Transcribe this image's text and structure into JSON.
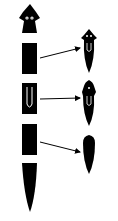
{
  "diagram": {
    "subject": "planarian regeneration",
    "colors": {
      "fill": "#000000",
      "background": "#ffffff",
      "detail": "#ffffff"
    },
    "original_fragments": [
      {
        "id": "head",
        "features": [
          "eyes"
        ]
      },
      {
        "id": "segment-1",
        "features": []
      },
      {
        "id": "segment-2-pharynx",
        "features": [
          "pharynx"
        ]
      },
      {
        "id": "segment-3",
        "features": []
      },
      {
        "id": "tail",
        "features": []
      }
    ],
    "arrows": [
      {
        "from": "segment-1",
        "to": "regenerated-1"
      },
      {
        "from": "segment-2-pharynx",
        "to": "regenerated-2"
      },
      {
        "from": "segment-3",
        "to": "regenerated-3"
      }
    ],
    "regenerated": [
      {
        "id": "regenerated-1",
        "features": [
          "eyes",
          "pharynx"
        ]
      },
      {
        "id": "regenerated-2",
        "features": [
          "eye",
          "pharynx"
        ]
      },
      {
        "id": "regenerated-3",
        "features": []
      }
    ]
  }
}
